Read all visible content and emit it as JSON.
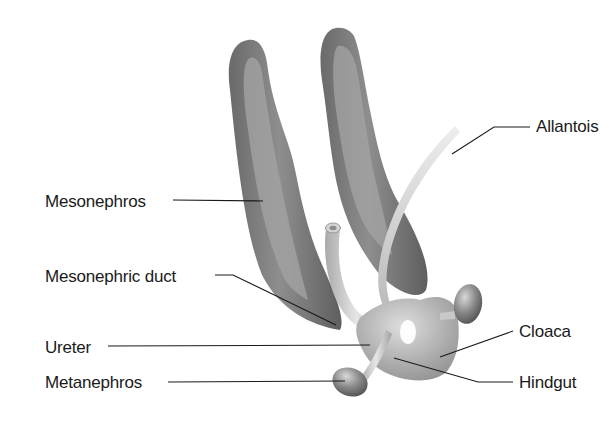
{
  "diagram": {
    "labels": [
      {
        "id": "allantois",
        "text": "Allantois"
      },
      {
        "id": "mesonephros",
        "text": "Mesonephros"
      },
      {
        "id": "mesonephric_duct",
        "text": "Mesonephric duct"
      },
      {
        "id": "ureter",
        "text": "Ureter"
      },
      {
        "id": "cloaca",
        "text": "Cloaca"
      },
      {
        "id": "metanephros",
        "text": "Metanephros"
      },
      {
        "id": "hindgut",
        "text": "Hindgut"
      }
    ],
    "colors": {
      "background": "#ffffff",
      "mesonephros_dark": "#6b6b6b",
      "mesonephros_light": "#9a9a9a",
      "duct": "#c8c8c8",
      "cloaca": "#a8a8a8",
      "leader_line": "#1a1a1a",
      "text": "#1a1a1a"
    }
  }
}
